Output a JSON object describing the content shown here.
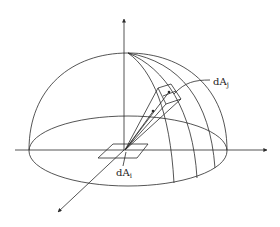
{
  "diagram": {
    "type": "hemisphere view-factor geometry",
    "labels": {
      "receiving_area": "dA",
      "receiving_area_sub": "j",
      "emitting_area": "dA",
      "emitting_area_sub": "i"
    },
    "colors": {
      "stroke": "#2a2a2a",
      "background": "#ffffff"
    }
  }
}
